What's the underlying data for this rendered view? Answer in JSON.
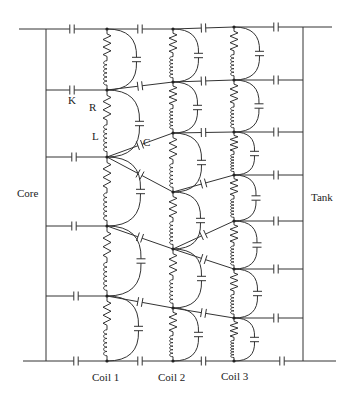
{
  "diagram": {
    "labels": {
      "core": "Core",
      "tank": "Tank",
      "coil1": "Coil 1",
      "coil2": "Coil 2",
      "coil3": "Coil 3",
      "K": "K",
      "R": "R",
      "L": "L",
      "C": "C"
    },
    "label_positions": {
      "core": [
        17,
        197
      ],
      "tank": [
        311,
        201
      ],
      "coil1": [
        92,
        381
      ],
      "coil2": [
        158,
        381
      ],
      "coil3": [
        221,
        380
      ],
      "K": [
        68,
        104
      ],
      "R": [
        89,
        111
      ],
      "L": [
        92,
        140
      ],
      "C": [
        143,
        146
      ]
    },
    "core_x": 46,
    "tank_x": 303,
    "top_y": 29,
    "bottom_y": 361,
    "top_line": [
      19,
      332
    ],
    "bottom_line": [
      23,
      336
    ],
    "coils": [
      {
        "name": "Coil 1",
        "x": 107,
        "nodes": [
          29,
          90,
          157,
          226,
          296,
          361
        ]
      },
      {
        "name": "Coil 2",
        "x": 173,
        "nodes": [
          29,
          82,
          133,
          192,
          249,
          308,
          361
        ]
      },
      {
        "name": "Coil 3",
        "x": 234,
        "nodes": [
          27,
          80,
          132,
          175,
          221,
          269,
          318,
          361
        ]
      }
    ],
    "core_links": [
      {
        "y": 29,
        "cap_x": 72
      },
      {
        "y": 90,
        "cap_x": 72
      },
      {
        "y": 157,
        "cap_x": 74
      },
      {
        "y": 226,
        "cap_x": 74
      },
      {
        "y": 296,
        "cap_x": 76
      },
      {
        "y": 361,
        "cap_x": 76
      }
    ],
    "tank_links": [
      {
        "y": 27,
        "cap_x": 276
      },
      {
        "y": 80,
        "cap_x": 276
      },
      {
        "y": 132,
        "cap_x": 276
      },
      {
        "y": 175,
        "cap_x": 276
      },
      {
        "y": 221,
        "cap_x": 276
      },
      {
        "y": 269,
        "cap_x": 276
      },
      {
        "y": 318,
        "cap_x": 276
      },
      {
        "y": 361,
        "cap_x": 282
      }
    ],
    "inter_links": [
      {
        "from": [
          107,
          29
        ],
        "to": [
          173,
          29
        ]
      },
      {
        "from": [
          107,
          90
        ],
        "to": [
          173,
          82
        ]
      },
      {
        "from": [
          107,
          157
        ],
        "to": [
          173,
          133
        ]
      },
      {
        "from": [
          107,
          157
        ],
        "to": [
          173,
          192
        ]
      },
      {
        "from": [
          107,
          226
        ],
        "to": [
          173,
          249
        ]
      },
      {
        "from": [
          107,
          296
        ],
        "to": [
          173,
          308
        ]
      },
      {
        "from": [
          107,
          361
        ],
        "to": [
          173,
          361
        ]
      },
      {
        "from": [
          173,
          29
        ],
        "to": [
          234,
          27
        ]
      },
      {
        "from": [
          173,
          82
        ],
        "to": [
          234,
          80
        ]
      },
      {
        "from": [
          173,
          133
        ],
        "to": [
          234,
          132
        ]
      },
      {
        "from": [
          173,
          192
        ],
        "to": [
          234,
          175
        ]
      },
      {
        "from": [
          173,
          249
        ],
        "to": [
          234,
          221
        ]
      },
      {
        "from": [
          173,
          249
        ],
        "to": [
          234,
          269
        ]
      },
      {
        "from": [
          173,
          308
        ],
        "to": [
          234,
          318
        ]
      },
      {
        "from": [
          173,
          361
        ],
        "to": [
          234,
          361
        ]
      }
    ],
    "components": {
      "series_element": "resistor-inductor",
      "shunt_element": "capacitor-arc",
      "coupling_element": "capacitor"
    }
  }
}
